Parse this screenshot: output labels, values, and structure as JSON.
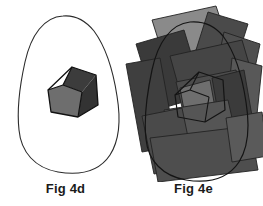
{
  "figure": {
    "background_color": "#ffffff",
    "panels": [
      {
        "id": "fig-4d",
        "caption": "Fig 4d",
        "description": "Closed blob outline containing a single pentagon partitioned into three shaded faces",
        "outline": {
          "name": "blob-outline",
          "stroke": "#2b2b2b",
          "stroke_width": 1.1,
          "fill": "#ffffff",
          "path": "M 63 16 C 44 17 31 35 25 62 C 19 89 17 112 19 130 C 21 152 35 168 58 172 C 82 176 100 170 110 155 C 119 141 121 120 117 96 C 113 70 105 46 94 31 C 85 20 74 15 63 16 Z"
        },
        "pentagon": {
          "name": "pentagon-outline",
          "stroke": "#1a1a1a",
          "stroke_width": 1.2,
          "faces": [
            {
              "name": "pentagon-face-top",
              "fill": "#3c3c3c",
              "path": "M 72 67 L 96 75 L 82 92 L 63 85 Z"
            },
            {
              "name": "pentagon-face-left",
              "fill": "#6e6e6e",
              "path": "M 63 85 L 82 92 L 78 117 L 51 112 L 48 90 Z"
            },
            {
              "name": "pentagon-face-right",
              "fill": "#333333",
              "path": "M 96 75 L 98 105 L 78 117 L 82 92 Z"
            }
          ],
          "boundary": "M 72 67 L 96 75 L 98 105 L 78 117 L 51 112 L 48 90 Z",
          "inner_edges": [
            "M 63 85 L 82 92",
            "M 82 92 L 78 117",
            "M 48 90 L 63 85",
            "M 63 85 L 72 67"
          ]
        }
      },
      {
        "id": "fig-4e",
        "caption": "Fig 4e",
        "description": "The same blob and pentagon overlaid by many rotated translucent gray quadrilateral patches",
        "outline": {
          "name": "blob-outline",
          "stroke": "#1a1a1a",
          "stroke_width": 1.2,
          "fill": "none",
          "path": "M 66 22 C 47 24 34 42 28 70 C 22 98 20 121 22 139 C 24 161 39 176 62 180 C 87 184 105 177 115 162 C 124 148 126 127 122 102 C 118 75 110 51 99 36 C 90 25 78 21 66 22 Z"
        },
        "patches": [
          {
            "name": "patch-01",
            "fill": "#8a8a8a",
            "opacity": 0.95,
            "path": "M 28 20 L 92 6 L 104 42 L 40 58 Z"
          },
          {
            "name": "patch-02",
            "fill": "#4a4a4a",
            "opacity": 0.95,
            "path": "M 84 12 L 124 24 L 112 62 L 72 50 Z"
          },
          {
            "name": "patch-03",
            "fill": "#3a3a3a",
            "opacity": 0.95,
            "path": "M 12 44 L 60 30 L 80 96 L 32 110 Z"
          },
          {
            "name": "patch-04",
            "fill": "#4f4f4f",
            "opacity": 0.95,
            "path": "M 100 32 L 136 44 L 128 82 L 92 70 Z"
          },
          {
            "name": "patch-05",
            "fill": "#454545",
            "opacity": 0.95,
            "path": "M 46 56 L 118 40 L 128 74 L 56 92 Z"
          },
          {
            "name": "patch-06",
            "fill": "#3f3f3f",
            "opacity": 0.95,
            "path": "M 2 64 L 36 58 L 52 146 L 18 152 Z"
          },
          {
            "name": "patch-07",
            "fill": "#585858",
            "opacity": 0.95,
            "path": "M 108 58 L 138 66 L 132 124 L 102 116 Z"
          },
          {
            "name": "patch-08",
            "fill": "#4c4c4c",
            "opacity": 0.95,
            "path": "M 52 82 L 112 70 L 122 112 L 62 124 Z"
          },
          {
            "name": "patch-09",
            "fill": "#6e6e6e",
            "opacity": 0.95,
            "path": "M 56 88 L 86 80 L 94 124 L 64 132 Z"
          },
          {
            "name": "patch-10",
            "fill": "#3b3b3b",
            "opacity": 0.95,
            "path": "M 88 78 L 120 70 L 128 116 L 96 124 Z"
          },
          {
            "name": "patch-11",
            "fill": "#555555",
            "opacity": 0.95,
            "path": "M 40 110 L 104 100 L 112 136 L 48 146 Z"
          },
          {
            "name": "patch-12",
            "fill": "#4a4a4a",
            "opacity": 0.95,
            "path": "M 18 116 L 58 108 L 70 166 L 30 174 Z"
          },
          {
            "name": "patch-13",
            "fill": "#4e4e4e",
            "opacity": 0.95,
            "path": "M 26 138 L 126 126 L 134 170 L 34 182 Z"
          },
          {
            "name": "patch-14",
            "fill": "#5a5a5a",
            "opacity": 0.95,
            "path": "M 102 118 L 138 112 L 144 156 L 108 162 Z"
          }
        ],
        "pentagon": {
          "name": "pentagon-outline",
          "stroke": "#1a1a1a",
          "stroke_width": 1.2,
          "faces": [
            {
              "name": "pentagon-face-top",
              "fill": "#3c3c3c",
              "opacity": 0.0,
              "path": "M 75 72 L 99 80 L 85 97 L 66 90 Z"
            },
            {
              "name": "pentagon-face-left",
              "fill": "#6e6e6e",
              "opacity": 0.0,
              "path": "M 66 90 L 85 97 L 81 122 L 54 117 L 51 95 Z"
            },
            {
              "name": "pentagon-face-right",
              "fill": "#333333",
              "opacity": 0.0,
              "path": "M 99 80 L 101 110 L 81 122 L 85 97 Z"
            }
          ],
          "boundary": "M 75 72 L 99 80 L 101 110 L 81 122 L 54 117 L 51 95 Z",
          "inner_edges": [
            "M 66 90 L 85 97",
            "M 85 97 L 81 122",
            "M 51 95 L 66 90",
            "M 66 90 L 75 72"
          ]
        }
      }
    ]
  }
}
